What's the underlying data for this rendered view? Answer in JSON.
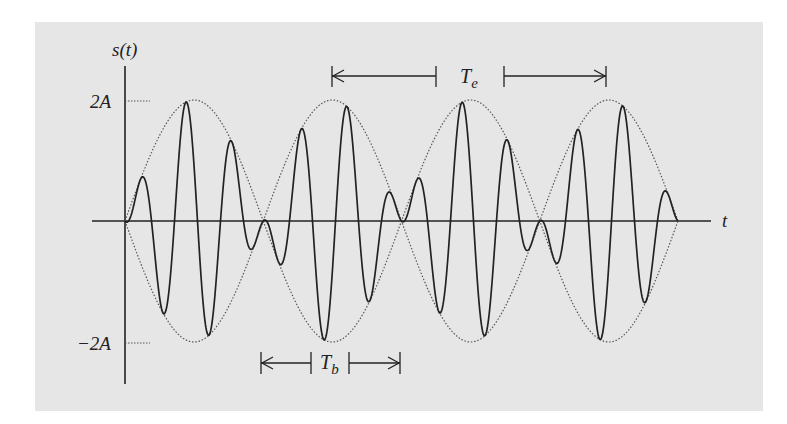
{
  "diagram": {
    "y_axis_label": "s(t)",
    "x_axis_label": "t",
    "y_ticks": [
      {
        "label": "2A",
        "value": 2
      },
      {
        "label": "−2A",
        "value": -2
      }
    ],
    "annotations": [
      {
        "label": "T",
        "subscript": "e",
        "meaning": "envelope period (peak to peak)"
      },
      {
        "label": "T",
        "subscript": "b",
        "meaning": "beat period (node to node)"
      }
    ],
    "colors": {
      "background": "#e6e6e6",
      "signal": "#222222",
      "envelope": "#555555"
    }
  },
  "chart_data": {
    "type": "line",
    "title": "",
    "xlabel": "t",
    "ylabel": "s(t)",
    "ylim": [
      -2,
      2
    ],
    "series": [
      {
        "name": "signal",
        "style": "solid",
        "envelope_lobes": 4,
        "carrier_cycles_per_lobe": 3
      },
      {
        "name": "envelope",
        "style": "dotted",
        "amplitude": 2
      }
    ]
  }
}
